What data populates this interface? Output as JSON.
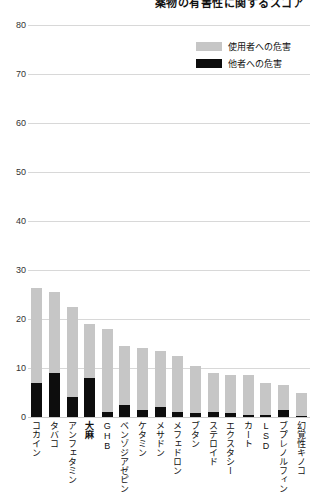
{
  "chart_data": {
    "type": "bar",
    "title": "薬物の有害性に関するスコア",
    "xlabel": "",
    "ylabel": "",
    "ylim": [
      0,
      80
    ],
    "yticks": [
      80,
      70,
      60,
      50,
      40,
      30,
      20,
      10,
      0
    ],
    "grid": true,
    "stacked": true,
    "legend_position": "top-right",
    "categories": [
      "コカイン",
      "タバコ",
      "アンフェタミン",
      "大麻",
      "GHB",
      "ベンゾジアゼピン",
      "ケタミン",
      "メサドン",
      "メフェドロン",
      "ブタン",
      "ステロイド",
      "エクスタシー",
      "カート",
      "LSD",
      "ブプレノルフィン",
      "幻覚性キノコ"
    ],
    "emphasized_category": "大麻",
    "series": [
      {
        "name": "他者への危害",
        "color": "#0d0d0d",
        "values": [
          7.0,
          9.0,
          4.0,
          8.0,
          1.0,
          2.5,
          1.5,
          2.0,
          1.0,
          0.8,
          1.0,
          0.8,
          0.5,
          0.4,
          1.5,
          0.3
        ]
      },
      {
        "name": "使用者への危害",
        "color": "#c6c6c6",
        "values": [
          19.3,
          16.5,
          18.5,
          11.0,
          17.0,
          12.0,
          12.5,
          11.5,
          11.5,
          9.7,
          8.0,
          7.7,
          8.0,
          6.6,
          5.0,
          4.7
        ]
      }
    ],
    "totals": [
      26.3,
      25.5,
      22.5,
      19.0,
      18.0,
      14.5,
      14.0,
      13.5,
      12.5,
      10.5,
      9.0,
      8.5,
      8.5,
      7.0,
      6.5,
      5.0
    ]
  },
  "legend": {
    "items": [
      {
        "label": "使用者への危害",
        "swatch": "gray-swatch"
      },
      {
        "label": "他者への危害",
        "swatch": "black-swatch"
      }
    ]
  }
}
